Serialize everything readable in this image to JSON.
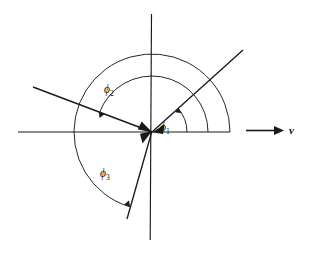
{
  "figure": {
    "type": "angle-diagram",
    "background_color": "#ffffff",
    "stroke_color": "#1a1a1a",
    "width": 309,
    "height": 255,
    "origin": {
      "x": 152,
      "y": 132
    }
  },
  "axes": {
    "horizontal": {
      "name": "x-axis",
      "x1": 18,
      "y1": 132,
      "x2": 230,
      "y2": 132
    },
    "vertical": {
      "name": "y-axis",
      "x1": 151,
      "y1": 14,
      "x2": 150,
      "y2": 240
    }
  },
  "rays": [
    {
      "id": "ray-phi1",
      "label": "φ₁",
      "angle_deg": 41,
      "tip": {
        "x": 243,
        "y": 50
      },
      "arrowhead_at": "origin"
    },
    {
      "id": "ray-phi2",
      "label": "φ₂",
      "angle_deg": 160,
      "tip": {
        "x": 33,
        "y": 87
      },
      "arrowhead_at": "origin"
    },
    {
      "id": "ray-phi3",
      "label": "φ₃",
      "angle_deg": 253,
      "tip": {
        "x": 127,
        "y": 219
      },
      "arrowhead_at": "origin"
    }
  ],
  "arcs": [
    {
      "id": "arc-phi1",
      "label": "φ₁",
      "radius": 35,
      "start_deg": 0,
      "end_deg": 41,
      "direction": "counterclockwise",
      "arrowhead_at": "end"
    },
    {
      "id": "arc-phi2",
      "label": "φ₂",
      "radius": 56,
      "start_deg": 0,
      "end_deg": 160,
      "direction": "counterclockwise",
      "arrowhead_at": "end"
    },
    {
      "id": "arc-phi3",
      "label": "φ₃",
      "radius": 78,
      "start_deg": 0,
      "end_deg": 253,
      "direction": "counterclockwise",
      "arrowhead_at": "end"
    }
  ],
  "labels": {
    "phi1": {
      "symbol": "ϕ",
      "subscript": "1",
      "x": 160,
      "y": 131
    },
    "phi2": {
      "symbol": "ϕ",
      "subscript": "2",
      "x": 104,
      "y": 93
    },
    "phi3": {
      "symbol": "ϕ",
      "subscript": "3",
      "x": 100,
      "y": 177
    }
  },
  "vector": {
    "name": "velocity-vector",
    "label": "v",
    "x1": 246,
    "y1": 130,
    "x2": 283,
    "y2": 130,
    "label_x": 289,
    "label_y": 134
  }
}
